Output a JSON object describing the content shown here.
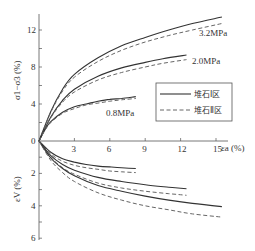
{
  "chart_data": {
    "type": "line",
    "title": "",
    "xlabel": "εa (%)",
    "ylabel_upper": "σ1−σ3 (%)",
    "ylabel_lower": "εV (%)",
    "x_ticks": [
      3,
      6,
      9,
      12,
      15
    ],
    "x_tick_labels": [
      "3",
      "6",
      "9",
      "12",
      "15"
    ],
    "xlim": [
      0,
      16
    ],
    "upper_ylim": [
      0,
      13.5
    ],
    "upper_y_ticks": [
      4,
      8,
      12
    ],
    "upper_y_minor": [
      2,
      4,
      6,
      8,
      10,
      12
    ],
    "lower_ylim": [
      0,
      6
    ],
    "lower_y_ticks": [
      0,
      2,
      4,
      6
    ],
    "lower_y_minor": [
      1,
      2,
      3,
      4,
      5,
      6
    ],
    "legend": {
      "position": "center-right",
      "entries": [
        {
          "name": "堆石Ⅰ区",
          "style": "solid"
        },
        {
          "name": "堆石Ⅱ区",
          "style": "dashed"
        }
      ]
    },
    "annotations": [
      "3.2MPa",
      "2.0MPa",
      "0.8MPa"
    ],
    "upper_series": [
      {
        "name": "3.2MPa 堆石Ⅰ区",
        "style": "solid",
        "x": [
          0,
          1,
          2,
          3,
          5,
          7,
          9,
          11,
          13,
          15.5
        ],
        "y": [
          0,
          3.2,
          5.6,
          7.2,
          9.0,
          10.3,
          11.2,
          12.0,
          12.7,
          13.4
        ]
      },
      {
        "name": "3.2MPa 堆石Ⅱ区",
        "style": "dashed",
        "x": [
          0,
          1,
          2,
          3,
          5,
          7,
          9,
          11,
          13,
          15.5
        ],
        "y": [
          0,
          3.1,
          5.4,
          6.9,
          8.6,
          9.8,
          10.7,
          11.4,
          12.0,
          12.7
        ]
      },
      {
        "name": "2.0MPa 堆石Ⅰ区",
        "style": "solid",
        "x": [
          0,
          1,
          2,
          3,
          5,
          7,
          9,
          10.5,
          12.5
        ],
        "y": [
          0,
          2.6,
          4.4,
          5.6,
          7.0,
          7.9,
          8.5,
          8.9,
          9.3
        ]
      },
      {
        "name": "2.0MPa 堆石Ⅱ区",
        "style": "dashed",
        "x": [
          0,
          1,
          2,
          3,
          5,
          7,
          9,
          10.5,
          12.5
        ],
        "y": [
          0,
          2.5,
          4.2,
          5.3,
          6.6,
          7.4,
          8.0,
          8.4,
          8.8
        ]
      },
      {
        "name": "0.8MPa 堆石Ⅰ区",
        "style": "solid",
        "x": [
          0,
          0.5,
          1,
          2,
          3,
          4,
          5,
          6,
          7,
          8.2
        ],
        "y": [
          0,
          1.2,
          2.1,
          3.1,
          3.7,
          4.0,
          4.3,
          4.5,
          4.6,
          4.8
        ]
      },
      {
        "name": "0.8MPa 堆石Ⅱ区",
        "style": "dashed",
        "x": [
          0,
          0.5,
          1,
          2,
          3,
          4,
          5,
          6,
          7,
          8.2
        ],
        "y": [
          0,
          1.15,
          2.0,
          3.0,
          3.5,
          3.9,
          4.1,
          4.3,
          4.45,
          4.6
        ]
      }
    ],
    "lower_series": [
      {
        "name": "0.8MPa 堆石Ⅰ区",
        "style": "solid",
        "x": [
          0,
          1,
          2,
          3,
          4,
          5,
          6,
          7,
          8.2
        ],
        "y": [
          0,
          0.7,
          1.1,
          1.3,
          1.45,
          1.55,
          1.6,
          1.65,
          1.7
        ]
      },
      {
        "name": "0.8MPa 堆石Ⅱ区",
        "style": "dashed",
        "x": [
          0,
          1,
          2,
          3,
          4,
          5,
          6,
          7,
          8.2
        ],
        "y": [
          0,
          0.8,
          1.25,
          1.5,
          1.65,
          1.75,
          1.85,
          1.9,
          1.95
        ]
      },
      {
        "name": "2.0MPa 堆石Ⅰ区",
        "style": "solid",
        "x": [
          0,
          1,
          2,
          3,
          5,
          7,
          9,
          11,
          12.5
        ],
        "y": [
          0,
          0.9,
          1.45,
          1.8,
          2.25,
          2.5,
          2.7,
          2.85,
          2.95
        ]
      },
      {
        "name": "2.0MPa 堆石Ⅱ区",
        "style": "dashed",
        "x": [
          0,
          1,
          2,
          3,
          5,
          7,
          9,
          11,
          12.5
        ],
        "y": [
          0,
          1.0,
          1.65,
          2.05,
          2.6,
          2.9,
          3.1,
          3.25,
          3.35
        ]
      },
      {
        "name": "3.2MPa 堆石Ⅰ区",
        "style": "solid",
        "x": [
          0,
          1,
          2,
          3,
          5,
          7,
          9,
          11,
          13,
          15.5
        ],
        "y": [
          0,
          1.05,
          1.7,
          2.15,
          2.75,
          3.1,
          3.4,
          3.65,
          3.85,
          4.05
        ]
      },
      {
        "name": "3.2MPa 堆石Ⅱ区",
        "style": "dashed",
        "x": [
          0,
          1,
          2,
          3,
          5,
          7,
          9,
          11,
          13,
          15.5
        ],
        "y": [
          0,
          1.2,
          1.95,
          2.5,
          3.2,
          3.65,
          4.0,
          4.25,
          4.5,
          4.7
        ]
      }
    ]
  }
}
